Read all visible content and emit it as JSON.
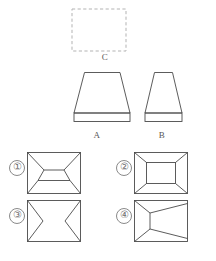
{
  "page": {
    "background_color": "#ffffff",
    "stroke_color": "#4a4a4a",
    "dashed_stroke_color": "#b0b0b0",
    "label_color": "#585858",
    "number_color": "#6e6e6e"
  },
  "prompt_shapes": [
    {
      "id": "C",
      "label": "C",
      "name": "dashed-square-c",
      "style": "dashed",
      "shape": "rectangle",
      "x": 72,
      "y": 9,
      "width": 54,
      "height": 42
    },
    {
      "id": "A",
      "label": "A",
      "name": "trapezoid-solid-a",
      "style": "solid",
      "shape": "trapezoid-with-base-band",
      "top_left_x": 84,
      "top_right_x": 120,
      "bottom_left_x": 74,
      "bottom_right_x": 130,
      "top_y": 72,
      "band_top_y": 113,
      "bottom_y": 122
    },
    {
      "id": "B",
      "label": "B",
      "name": "trapezoid-solid-b",
      "style": "solid",
      "shape": "trapezoid-with-base-band",
      "top_left_x": 154,
      "top_right_x": 173,
      "bottom_left_x": 145,
      "bottom_right_x": 182,
      "top_y": 72,
      "band_top_y": 113,
      "bottom_y": 122
    }
  ],
  "options": [
    {
      "number": "①",
      "name": "option-1",
      "description": "rectangle with inner trapezoid wider at bottom and four corner diagonals",
      "rect": {
        "x": 27,
        "y": 152,
        "width": 54,
        "height": 42
      },
      "inner": {
        "type": "trapezoid",
        "top_left_x": 44,
        "top_right_x": 64,
        "bottom_left_x": 38,
        "bottom_right_x": 70,
        "top_y": 170,
        "bottom_y": 180
      }
    },
    {
      "number": "②",
      "name": "option-2",
      "description": "rectangle with concentric inner rectangle and four corner diagonals",
      "rect": {
        "x": 134,
        "y": 152,
        "width": 54,
        "height": 42
      },
      "inner": {
        "type": "rectangle",
        "x": 146,
        "y": 162,
        "width": 30,
        "height": 22
      }
    },
    {
      "number": "③",
      "name": "option-3",
      "description": "rectangle with two inward pointing V shapes from left and right edges",
      "rect": {
        "x": 27,
        "y": 200,
        "width": 54,
        "height": 42
      },
      "inner": {
        "type": "double-v",
        "left_apex_x": 43,
        "right_apex_x": 65,
        "apex_y": 221
      }
    },
    {
      "number": "④",
      "name": "option-4",
      "description": "rectangle with inner trapezoid narrow at left, open to right edge, with diagonals",
      "rect": {
        "x": 134,
        "y": 200,
        "width": 54,
        "height": 42
      },
      "inner": {
        "type": "trapezoid-right",
        "left_x": 150,
        "left_top_y": 213,
        "left_bottom_y": 229,
        "right_x": 188,
        "right_top_y": 203,
        "right_bottom_y": 239
      }
    }
  ]
}
